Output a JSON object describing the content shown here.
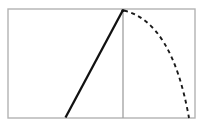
{
  "figure": {
    "title": "Pendulum swing arc diagram",
    "background_color": "#ffffff",
    "width": 202,
    "height": 127
  },
  "frame": {
    "name": "bounding-rectangle",
    "x": 8,
    "y": 9,
    "width": 187,
    "height": 109,
    "stroke_color": "#b3b3b3",
    "stroke_width": 1.4,
    "fill": "none"
  },
  "vertical_axis": {
    "name": "vertical-reference-line",
    "x": 123,
    "y_top": 10,
    "y_bottom": 118,
    "stroke_color": "#a0a0a0",
    "stroke_width": 1.3
  },
  "radius_line": {
    "name": "pendulum-rod",
    "x1": 65.5,
    "y1": 117.5,
    "x2": 123,
    "y2": 10,
    "stroke_color": "#111111",
    "stroke_width": 2.3
  },
  "arc": {
    "name": "swing-arc",
    "start_x": 124,
    "start_y": 10.5,
    "end_x": 189,
    "end_y": 118,
    "control_x": 172,
    "control_y": 22,
    "stroke_color": "#1a1a1a",
    "stroke_width": 1.9,
    "dash_pattern": "4 3.6",
    "style": "dashed"
  },
  "apex": {
    "name": "apex-point",
    "x": 123,
    "y": 10,
    "radius": 1.6,
    "color": "#111111"
  },
  "labels": {
    "none_visible": ""
  }
}
